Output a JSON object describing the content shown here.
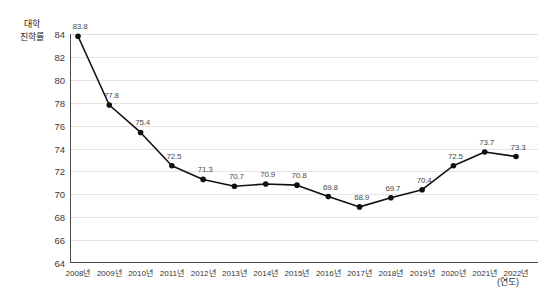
{
  "chart_data": {
    "type": "line",
    "title": "",
    "subtitle": "",
    "ylabel": "대학\n진학률",
    "ylabel_lines": [
      "대학",
      "진학률"
    ],
    "xlabel": "(연도)",
    "categories": [
      "2008년",
      "2009년",
      "2010년",
      "2011년",
      "2012년",
      "2013년",
      "2014년",
      "2015년",
      "2016년",
      "2017년",
      "2018년",
      "2019년",
      "2020년",
      "2021년",
      "2022년"
    ],
    "x": [
      2008,
      2009,
      2010,
      2011,
      2012,
      2013,
      2014,
      2015,
      2016,
      2017,
      2018,
      2019,
      2020,
      2021,
      2022
    ],
    "values": [
      83.8,
      77.8,
      75.4,
      72.5,
      71.3,
      70.7,
      70.9,
      70.8,
      69.8,
      68.9,
      69.7,
      70.4,
      72.5,
      73.7,
      73.3
    ],
    "point_labels": [
      "83.8",
      "77.8",
      "75.4",
      "72.5",
      "71.3",
      "70.7",
      "70.9",
      "70.8",
      "69.8",
      "68.9",
      "69.7",
      "70.4",
      "72.5",
      "73.7",
      "73.3"
    ],
    "ylim": [
      64,
      84
    ],
    "yticks": [
      64,
      66,
      68,
      70,
      72,
      74,
      76,
      78,
      80,
      82,
      84
    ],
    "ytick_labels": [
      "64",
      "66",
      "68",
      "70",
      "72",
      "74",
      "76",
      "78",
      "80",
      "82",
      "84"
    ],
    "grid": true,
    "grid_axis": "y",
    "legend": false,
    "legend_position": "none",
    "series_color": "#111111",
    "marker": "circle",
    "marker_color": "#111111",
    "grid_color": "#e4e4e4",
    "axis_color": "#4a4a4a",
    "label_color": "#4a4a4a"
  }
}
